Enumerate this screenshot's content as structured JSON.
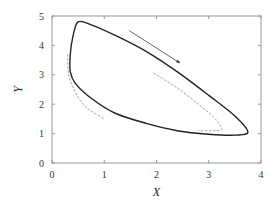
{
  "chart_data": {
    "type": "line",
    "title": "",
    "xlabel": "X",
    "ylabel": "Y",
    "xlim": [
      0,
      4
    ],
    "ylim": [
      0,
      5
    ],
    "xticks": [
      "0",
      "1",
      "2",
      "3",
      "4"
    ],
    "yticks": [
      "0",
      "1",
      "2",
      "3",
      "4",
      "5"
    ],
    "grid": false,
    "legend": null,
    "series": [
      {
        "name": "limit cycle (solid)",
        "style": "solid",
        "color": "#222222",
        "points": [
          [
            0.5,
            4.8
          ],
          [
            0.75,
            4.7
          ],
          [
            1.2,
            4.35
          ],
          [
            1.8,
            3.8
          ],
          [
            2.4,
            3.1
          ],
          [
            3.0,
            2.3
          ],
          [
            3.5,
            1.6
          ],
          [
            3.75,
            1.05
          ],
          [
            3.5,
            0.95
          ],
          [
            3.0,
            0.98
          ],
          [
            2.4,
            1.1
          ],
          [
            1.8,
            1.35
          ],
          [
            1.2,
            1.7
          ],
          [
            0.75,
            2.2
          ],
          [
            0.45,
            2.7
          ],
          [
            0.35,
            3.1
          ],
          [
            0.35,
            3.7
          ],
          [
            0.4,
            4.3
          ],
          [
            0.5,
            4.8
          ]
        ]
      },
      {
        "name": "dashed branch right",
        "style": "dashed",
        "color": "#999999",
        "points": [
          [
            1.95,
            3.05
          ],
          [
            2.4,
            2.55
          ],
          [
            2.8,
            2.0
          ],
          [
            3.1,
            1.55
          ],
          [
            3.25,
            1.15
          ],
          [
            3.1,
            1.1
          ],
          [
            2.8,
            1.1
          ]
        ]
      },
      {
        "name": "dashed branch left",
        "style": "dashed",
        "color": "#999999",
        "points": [
          [
            0.3,
            3.7
          ],
          [
            0.32,
            3.0
          ],
          [
            0.45,
            2.4
          ],
          [
            0.65,
            1.9
          ],
          [
            1.0,
            1.5
          ]
        ]
      }
    ],
    "annotations": [
      {
        "type": "arrow",
        "from": [
          1.48,
          4.5
        ],
        "to": [
          2.45,
          3.4
        ],
        "label": ""
      }
    ]
  }
}
